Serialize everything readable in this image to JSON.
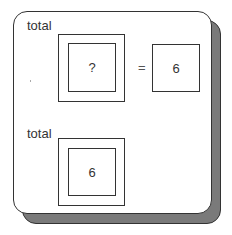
{
  "top": {
    "label": "total",
    "unknown_value": "?",
    "operator": "=",
    "result_value": "6"
  },
  "bottom": {
    "label": "total",
    "value": "6"
  },
  "colors": {
    "stroke": "#333333",
    "shadow": "#7a7a7a",
    "background": "#ffffff"
  }
}
